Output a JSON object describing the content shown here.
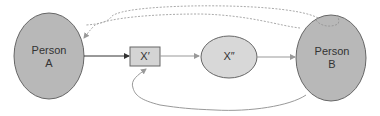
{
  "nodes": {
    "person_a": {
      "line1": "Person",
      "line2": "A"
    },
    "x_prime": {
      "label": "X′"
    },
    "x_double_prime": {
      "label": "X″"
    },
    "person_b": {
      "line1": "Person",
      "line2": "B"
    }
  },
  "colors": {
    "person_fill": "#b8b8b8",
    "x_prime_fill": "#d4d4d4",
    "x_double_fill": "#d8d8d8",
    "stroke": "#666666",
    "arrow_dark": "#333333",
    "arrow_light": "#999999",
    "dotted": "#aaaaaa"
  }
}
